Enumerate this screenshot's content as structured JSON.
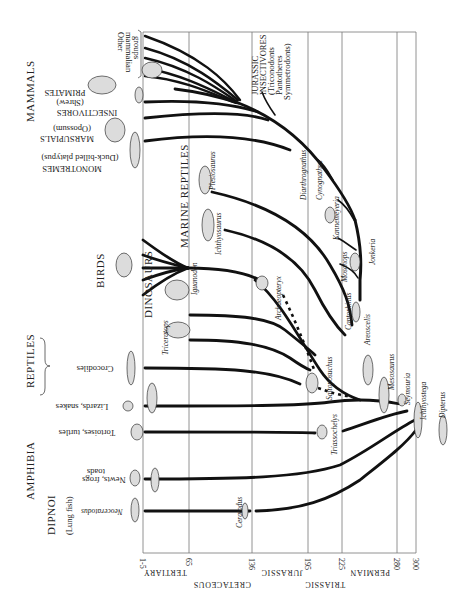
{
  "time_axis": {
    "unit": "million years ago",
    "ticks": [
      {
        "label": "1-5",
        "x": 143
      },
      {
        "label": "65",
        "x": 189
      },
      {
        "label": "136",
        "x": 252
      },
      {
        "label": "195",
        "x": 308
      },
      {
        "label": "225",
        "x": 342
      },
      {
        "label": "280",
        "x": 397
      },
      {
        "label": "300",
        "x": 416
      }
    ],
    "periods_row1": [
      {
        "label": "TERTIARY",
        "x": 165
      },
      {
        "label": "JURASSIC",
        "x": 282
      },
      {
        "label": "PERMIAN",
        "x": 370
      }
    ],
    "periods_row2": [
      {
        "label": "CRETACEOUS",
        "x": 222
      },
      {
        "label": "TRIASSIC",
        "x": 325
      }
    ]
  },
  "groups": {
    "mammals": "MAMMALS",
    "birds": "BIRDS",
    "reptiles": "REPTILES",
    "amphibia": "AMPHIBIA",
    "dipnoi": "DIPNOI",
    "dinosaurs": "DINOSAURS",
    "marine_reptiles": "MARINE REPTILES"
  },
  "living_labels": {
    "other_mammalian": [
      "Other",
      "mammalian",
      "groups"
    ],
    "primates": "PRIMATES",
    "insectivores": [
      "INSECTIVORES",
      "(Shrew)"
    ],
    "marsupials": [
      "MARSUPIALS",
      "(Opossum)"
    ],
    "monotremes": [
      "MONOTREMES",
      "(Duck-billed platypus)"
    ],
    "crocodiles": "Crocodiles",
    "lizards": "Lizards, snakes",
    "tortoises": "Tortoises, turtles",
    "newts": [
      "Newts, frogs",
      "toads"
    ],
    "lungfish": "(Lung fish)",
    "neoceratodus": "Neoceratodus"
  },
  "fossil_labels": {
    "jurassic_insectivores": [
      "JURASSIC",
      "INSECTIVORES",
      "(Triconodonts",
      "Pantotheres",
      "Symmetrodonts)"
    ],
    "plesiosaurus": "Plesiosaurus",
    "ichthyosaurus": "Ichthyosaurus",
    "iguanodon": "Iguanodon",
    "triceratops": "Triceratops",
    "archaeopteryx": "Archaeopteryx",
    "saltoposuchus": "Saltoposuchus",
    "diarthrognathus": "Diarthrognathus",
    "cynognathus": "Cynognathus",
    "kannemeyeria": "Kannemeyeria",
    "moschops": "Moschops",
    "jonkeria": "Jonkeria",
    "captorhinus": "Captorhinus",
    "areoscelis": "Areoscelis",
    "mesosaurus": "Mesosaurus",
    "seymouria": "Seymouria",
    "ichthyostega": "Ichthyostega",
    "triassochelys": "Triassochelys",
    "ceratodus": "Ceratodus",
    "dipterus": "Dipterus"
  }
}
